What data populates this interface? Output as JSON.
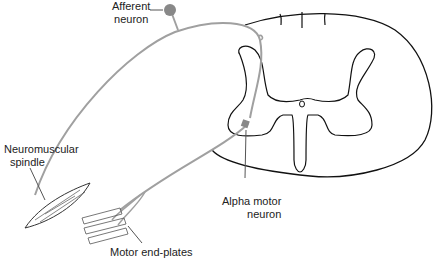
{
  "labels": {
    "afferent": [
      "Afferent",
      "neuron"
    ],
    "spindle": [
      "Neuromuscular",
      "spindle"
    ],
    "alpha": [
      "Alpha motor",
      "neuron"
    ],
    "endplates": "Motor end-plates"
  },
  "colors": {
    "nerve": "#a0a0a0",
    "outline": "#111111",
    "cell": "#8a8a8a"
  }
}
